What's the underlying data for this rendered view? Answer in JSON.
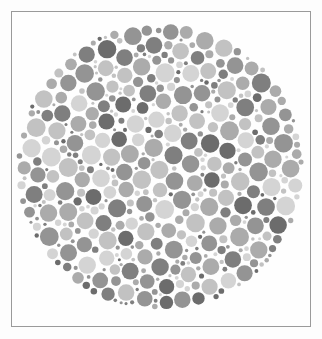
{
  "image": {
    "kind": "ishihara-test-plate",
    "title": "Ishihara colour vision test plate (greyscale)",
    "description": "Circular mosaic of densely packed dots of varying size and grey tone, forming a pseudoisochromatic plate. Rendered in greyscale so the embedded figure is not discernible.",
    "background_color": "#fdfdfd",
    "frame": {
      "border_color": "#9a9a9a",
      "border_width_px": 1,
      "x": 11,
      "y": 11,
      "width": 300,
      "height": 316,
      "fill_color": "#fefefe"
    },
    "plate": {
      "shape": "circle",
      "center_x": 160,
      "center_y": 167,
      "radius": 145,
      "dot_count": 760,
      "dot_min_diameter_px": 3,
      "dot_max_diameter_px": 19,
      "gap_color": "#fefefe"
    },
    "palette": {
      "tone_1": "#d4d4d4",
      "tone_2": "#c2c2c2",
      "tone_3": "#ababab",
      "tone_4": "#949494",
      "tone_5": "#7f7f7f",
      "tone_6": "#6c6c6c"
    },
    "tone_weights": [
      0.17,
      0.18,
      0.19,
      0.18,
      0.16,
      0.12
    ]
  }
}
